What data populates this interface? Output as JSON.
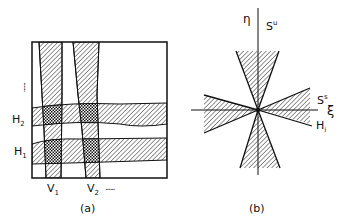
{
  "panel_a": {
    "caption": "(a)",
    "horizontal_labels": [
      {
        "base": "H",
        "sub": "2"
      },
      {
        "base": "H",
        "sub": "1"
      }
    ],
    "vertical_labels": [
      {
        "base": "V",
        "sub": "1"
      },
      {
        "base": "V",
        "sub": "2"
      }
    ],
    "ellipsis_h": "......",
    "ellipsis_v": "......"
  },
  "panel_b": {
    "caption": "(b)",
    "axis_vertical": "η",
    "axis_horizontal": "ξ",
    "unstable_label": {
      "base": "S",
      "sup": "u"
    },
    "stable_label": {
      "base": "S",
      "sup": "s"
    },
    "h_label": {
      "base": "H",
      "sub": "i"
    }
  },
  "colors": {
    "ink": "#111111",
    "background": "#ffffff"
  }
}
